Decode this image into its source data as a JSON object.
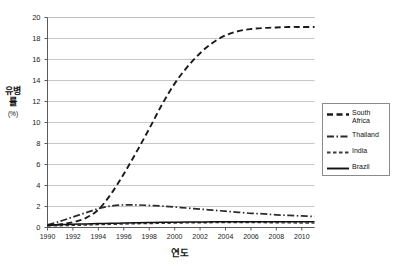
{
  "chart_data": {
    "type": "line",
    "title": "",
    "xlabel": "연도",
    "ylabel": "유병률",
    "ylabel_unit": "(%)",
    "xlim": [
      1990,
      2011
    ],
    "ylim": [
      0,
      20
    ],
    "grid": "horizontal",
    "legend_position": "right",
    "y_ticks": [
      0,
      2,
      4,
      6,
      8,
      10,
      12,
      14,
      16,
      18,
      20
    ],
    "x_ticks": [
      1990,
      1992,
      1994,
      1996,
      1998,
      2000,
      2002,
      2004,
      2006,
      2008,
      2010
    ],
    "x": [
      1990,
      1991,
      1992,
      1993,
      1994,
      1995,
      1996,
      1997,
      1998,
      1999,
      2000,
      2001,
      2002,
      2003,
      2004,
      2005,
      2006,
      2007,
      2008,
      2009,
      2010,
      2011
    ],
    "series": [
      {
        "name": "South Africa",
        "style": "dashed",
        "color": "#1a1a1a",
        "values": [
          0.2,
          0.3,
          0.5,
          0.9,
          1.7,
          3.2,
          5.1,
          7.2,
          9.4,
          11.7,
          13.7,
          15.3,
          16.6,
          17.6,
          18.3,
          18.7,
          18.9,
          19.0,
          19.05,
          19.1,
          19.1,
          19.1
        ]
      },
      {
        "name": "Thailand",
        "style": "dash-dot",
        "color": "#2b2b2b",
        "values": [
          0.25,
          0.6,
          1.0,
          1.4,
          1.8,
          2.05,
          2.15,
          2.15,
          2.1,
          2.05,
          1.95,
          1.85,
          1.75,
          1.65,
          1.55,
          1.45,
          1.35,
          1.3,
          1.2,
          1.15,
          1.1,
          1.05
        ]
      },
      {
        "name": "India",
        "style": "short-dash",
        "color": "#3a3a3a",
        "values": [
          0.15,
          0.17,
          0.2,
          0.23,
          0.27,
          0.3,
          0.33,
          0.36,
          0.38,
          0.4,
          0.42,
          0.44,
          0.45,
          0.46,
          0.47,
          0.47,
          0.47,
          0.46,
          0.45,
          0.44,
          0.43,
          0.42
        ]
      },
      {
        "name": "Brazil",
        "style": "solid",
        "color": "#111111",
        "values": [
          0.25,
          0.28,
          0.31,
          0.34,
          0.37,
          0.4,
          0.43,
          0.46,
          0.48,
          0.5,
          0.51,
          0.52,
          0.53,
          0.54,
          0.54,
          0.55,
          0.55,
          0.55,
          0.55,
          0.55,
          0.55,
          0.55
        ]
      }
    ]
  },
  "legend": {
    "items": [
      {
        "label": "South Africa",
        "style": "dashed"
      },
      {
        "label": "Thailand",
        "style": "dash-dot"
      },
      {
        "label": "India",
        "style": "short-dash"
      },
      {
        "label": "Brazil",
        "style": "solid"
      }
    ]
  },
  "axes": {
    "y_title": "유병률",
    "y_unit": "(%)",
    "x_title": "연도"
  }
}
